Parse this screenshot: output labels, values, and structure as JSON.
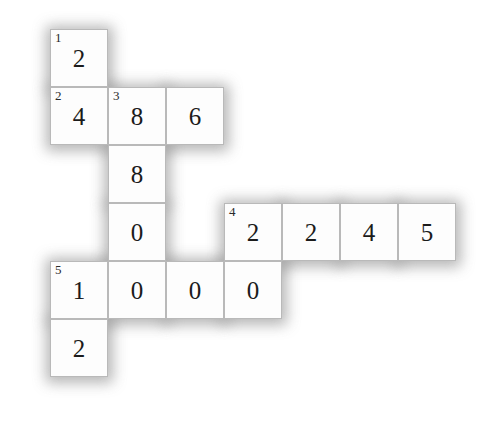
{
  "puzzle": {
    "type": "numeric-crossword-grid",
    "rows": 6,
    "columns": 7,
    "cell_size": 58,
    "origin_x": 50,
    "origin_y": 29,
    "colors": {
      "page_background": "#ffffff",
      "cell_background": "#fdfdfd",
      "cell_border": "#b9b9b9",
      "digit": "#1b1b1b",
      "clue_number": "#2a2a2a",
      "shadow": "#9a9a9a"
    },
    "cells": [
      {
        "row": 0,
        "col": 0,
        "value": "2",
        "clue": "1"
      },
      {
        "row": 1,
        "col": 0,
        "value": "4",
        "clue": "2"
      },
      {
        "row": 1,
        "col": 1,
        "value": "8",
        "clue": "3"
      },
      {
        "row": 1,
        "col": 2,
        "value": "6",
        "clue": ""
      },
      {
        "row": 2,
        "col": 1,
        "value": "8",
        "clue": ""
      },
      {
        "row": 3,
        "col": 1,
        "value": "0",
        "clue": ""
      },
      {
        "row": 3,
        "col": 3,
        "value": "2",
        "clue": "4"
      },
      {
        "row": 3,
        "col": 4,
        "value": "2",
        "clue": ""
      },
      {
        "row": 3,
        "col": 5,
        "value": "4",
        "clue": ""
      },
      {
        "row": 3,
        "col": 6,
        "value": "5",
        "clue": ""
      },
      {
        "row": 4,
        "col": 0,
        "value": "1",
        "clue": "5"
      },
      {
        "row": 4,
        "col": 1,
        "value": "0",
        "clue": ""
      },
      {
        "row": 4,
        "col": 2,
        "value": "0",
        "clue": ""
      },
      {
        "row": 4,
        "col": 3,
        "value": "0",
        "clue": ""
      },
      {
        "row": 5,
        "col": 0,
        "value": "2",
        "clue": ""
      }
    ],
    "entries": [
      {
        "number": "1",
        "direction": "down",
        "digits": "2 4"
      },
      {
        "number": "2",
        "direction": "across",
        "digits": "4 8 6"
      },
      {
        "number": "3",
        "direction": "down",
        "digits": "8 8 0 0"
      },
      {
        "number": "4",
        "direction": "across",
        "digits": "2 2 4 5"
      },
      {
        "number": "5",
        "direction": "across",
        "digits": "1 0 0 0"
      }
    ]
  }
}
